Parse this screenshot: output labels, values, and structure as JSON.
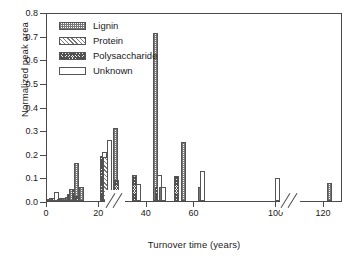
{
  "chart_data": {
    "type": "bar",
    "title": "",
    "xlabel": "Turnover time (years)",
    "ylabel": "Normalized peak area",
    "xlim": [
      0,
      128
    ],
    "ylim": [
      0.0,
      0.8
    ],
    "grid": false,
    "legend_position": "top-left",
    "x_ticks": [
      "0",
      "20",
      "40",
      "60",
      "100",
      "120"
    ],
    "x_tick_values": [
      0,
      20,
      40,
      60,
      100,
      120
    ],
    "y_ticks": [
      "0.0",
      "0.1",
      "0.2",
      "0.3",
      "0.4",
      "0.5",
      "0.6",
      "0.7",
      "0.8"
    ],
    "y_tick_values": [
      0.0,
      0.1,
      0.2,
      0.3,
      0.4,
      0.5,
      0.6,
      0.7,
      0.8
    ],
    "axis_breaks": [
      [
        15.5,
        19.0
      ],
      [
        67.0,
        78.0
      ]
    ],
    "series": [
      {
        "name": "Lignin",
        "pattern": "dotted-checker",
        "color": "#777777"
      },
      {
        "name": "Protein",
        "pattern": "diagonal-hatch",
        "color": "#7a7a7a"
      },
      {
        "name": "Polysaccharide",
        "pattern": "dense-cross-hatch",
        "color": "#4f4f4f"
      },
      {
        "name": "Unknown",
        "pattern": "empty",
        "color": "#ffffff"
      }
    ],
    "points": [
      {
        "x": 1.2,
        "y": 0.008,
        "series": "Unknown"
      },
      {
        "x": 2.0,
        "y": 0.012,
        "series": "Lignin"
      },
      {
        "x": 2.8,
        "y": 0.014,
        "series": "Polysaccharide"
      },
      {
        "x": 4.0,
        "y": 0.04,
        "series": "Unknown"
      },
      {
        "x": 5.2,
        "y": 0.01,
        "series": "Lignin"
      },
      {
        "x": 6.1,
        "y": 0.012,
        "series": "Polysaccharide"
      },
      {
        "x": 7.0,
        "y": 0.011,
        "series": "Lignin"
      },
      {
        "x": 7.9,
        "y": 0.013,
        "series": "Protein"
      },
      {
        "x": 8.8,
        "y": 0.016,
        "series": "Lignin"
      },
      {
        "x": 9.6,
        "y": 0.03,
        "series": "Polysaccharide"
      },
      {
        "x": 10.5,
        "y": 0.05,
        "series": "Lignin"
      },
      {
        "x": 11.4,
        "y": 0.046,
        "series": "Polysaccharide"
      },
      {
        "x": 12.2,
        "y": 0.16,
        "series": "Lignin"
      },
      {
        "x": 13.0,
        "y": 0.02,
        "series": "Polysaccharide"
      },
      {
        "x": 14.3,
        "y": 0.06,
        "series": "Lignin"
      },
      {
        "x": 21.2,
        "y": 0.19,
        "series": "Polysaccharide"
      },
      {
        "x": 22.0,
        "y": 0.207,
        "series": "Unknown"
      },
      {
        "x": 22.8,
        "y": 0.185,
        "series": "Protein"
      },
      {
        "x": 24.2,
        "y": 0.26,
        "series": "Unknown"
      },
      {
        "x": 26.7,
        "y": 0.31,
        "series": "Lignin"
      },
      {
        "x": 27.3,
        "y": 0.09,
        "series": "Polysaccharide"
      },
      {
        "x": 35.0,
        "y": 0.11,
        "series": "Polysaccharide"
      },
      {
        "x": 36.3,
        "y": 0.07,
        "series": "Unknown"
      },
      {
        "x": 43.8,
        "y": 0.71,
        "series": "Lignin"
      },
      {
        "x": 44.4,
        "y": 0.06,
        "series": "Polysaccharide"
      },
      {
        "x": 45.4,
        "y": 0.11,
        "series": "Unknown"
      },
      {
        "x": 46.0,
        "y": 0.06,
        "series": "Lignin"
      },
      {
        "x": 46.9,
        "y": 0.06,
        "series": "Unknown"
      },
      {
        "x": 52.6,
        "y": 0.108,
        "series": "Polysaccharide"
      },
      {
        "x": 55.6,
        "y": 0.25,
        "series": "Lignin"
      },
      {
        "x": 62.6,
        "y": 0.058,
        "series": "Lignin"
      },
      {
        "x": 63.4,
        "y": 0.128,
        "series": "Unknown"
      },
      {
        "x": 100.6,
        "y": 0.098,
        "series": "Unknown"
      },
      {
        "x": 122.4,
        "y": 0.078,
        "series": "Lignin"
      }
    ]
  },
  "legend": {
    "items": [
      {
        "label": "Lignin",
        "key": "lignin"
      },
      {
        "label": "Protein",
        "key": "protein"
      },
      {
        "label": "Polysaccharide",
        "key": "polysaccharide"
      },
      {
        "label": "Unknown",
        "key": "unknown"
      }
    ]
  },
  "axes": {
    "x_title": "Turnover time (years)",
    "y_title": "Normalized peak area"
  }
}
